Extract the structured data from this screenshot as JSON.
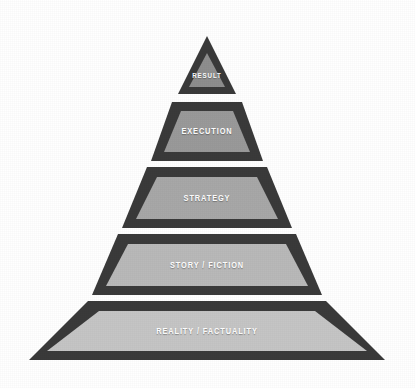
{
  "figure": {
    "type": "pyramid-diagram",
    "background_color": "#ffffff",
    "border_color": "#3a3a3a",
    "label_color": "#ffffff",
    "tier_count": 5,
    "apex": {
      "x": 207,
      "y": 36
    },
    "base_left": {
      "x": 29,
      "y": 360
    },
    "base_right": {
      "x": 385,
      "y": 360
    }
  },
  "tiers": [
    {
      "index": 1,
      "label": "RESULT",
      "fill_color": "#8e8e8e",
      "font_size": 7.5,
      "outer": "207,36 178,94 236,94",
      "inner": "207,53 189,87 225,87",
      "label_x": 207,
      "label_y": 75
    },
    {
      "index": 2,
      "label": "EXECUTION",
      "fill_color": "#9a9a9a",
      "font_size": 9,
      "outer": "172,102 242,102 263,161 151,161",
      "inner": "181,111 233,111 250,152 164,152",
      "label_x": 207,
      "label_y": 131
    },
    {
      "index": 3,
      "label": "STRATEGY",
      "fill_color": "#a8a8a8",
      "font_size": 9,
      "outer": "147,167 267,167 292,228 122,228",
      "inner": "157,177 257,177 278,219 136,219",
      "label_x": 207,
      "label_y": 198
    },
    {
      "index": 4,
      "label": "STORY / FICTION",
      "fill_color": "#b9b9b9",
      "font_size": 9,
      "outer": "118,234 296,234 322,295 92,295",
      "inner": "128,244 286,244 308,286 106,286",
      "label_x": 207,
      "label_y": 265
    },
    {
      "index": 5,
      "label": "REALITY / FACTUALITY",
      "fill_color": "#c5c5c5",
      "font_size": 9,
      "outer": "88,301 326,301 385,360 29,360",
      "inner": "99,311 315,311 367,351 47,351",
      "label_x": 207,
      "label_y": 331
    }
  ]
}
